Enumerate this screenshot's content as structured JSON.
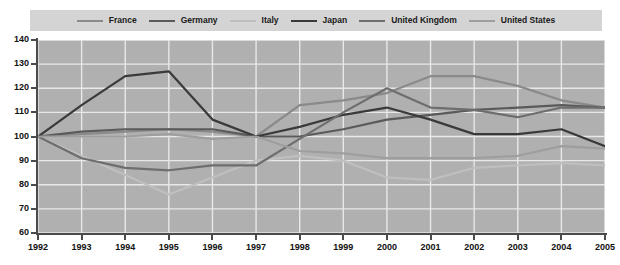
{
  "chart_data": {
    "type": "line",
    "title": "",
    "xlabel": "",
    "ylabel": "",
    "ylim": [
      60,
      140
    ],
    "ytick_step": 10,
    "yticks": [
      140,
      130,
      120,
      110,
      100,
      90,
      80,
      70,
      60
    ],
    "grid": true,
    "legend_position": "top",
    "categories": [
      "1992",
      "1993",
      "1994",
      "1995",
      "1996",
      "1997",
      "1998",
      "1999",
      "2000",
      "2001",
      "2002",
      "2003",
      "2004",
      "2005"
    ],
    "series": [
      {
        "name": "France",
        "color": "#8a8a8a",
        "values": [
          100,
          101,
          102,
          103,
          102,
          100,
          113,
          115,
          118,
          125,
          125,
          121,
          115,
          112
        ]
      },
      {
        "name": "Germany",
        "color": "#5a5a5a",
        "values": [
          100,
          102,
          103,
          103,
          103,
          100,
          100,
          103,
          107,
          109,
          111,
          112,
          113,
          112
        ]
      },
      {
        "name": "Italy",
        "color": "#bfbfbf",
        "values": [
          100,
          92,
          84,
          76,
          83,
          90,
          92,
          90,
          83,
          82,
          87,
          88,
          89,
          88
        ]
      },
      {
        "name": "Japan",
        "color": "#3a3a3a",
        "values": [
          100,
          113,
          125,
          127,
          107,
          100,
          104,
          109,
          112,
          107,
          101,
          101,
          103,
          96
        ]
      },
      {
        "name": "United Kingdom",
        "color": "#6e6e6e",
        "values": [
          100,
          91,
          87,
          86,
          88,
          88,
          99,
          110,
          120,
          112,
          111,
          108,
          112,
          112
        ]
      },
      {
        "name": "United States",
        "color": "#9e9e9e",
        "values": [
          100,
          100,
          100,
          101,
          99,
          100,
          94,
          93,
          91,
          91,
          91,
          92,
          96,
          95
        ]
      }
    ]
  },
  "legend": {
    "items": [
      {
        "label": "France"
      },
      {
        "label": "Germany"
      },
      {
        "label": "Italy"
      },
      {
        "label": "Japan"
      },
      {
        "label": "United Kingdom"
      },
      {
        "label": "United States"
      }
    ]
  },
  "axes": {
    "y_labels": [
      "140",
      "130",
      "120",
      "110",
      "100",
      "90",
      "80",
      "70",
      "60"
    ],
    "x_labels": [
      "1992",
      "1993",
      "1994",
      "1995",
      "1996",
      "1997",
      "1998",
      "1999",
      "2000",
      "2001",
      "2002",
      "2003",
      "2004",
      "2005"
    ]
  },
  "colors": {
    "plot_background": "#b0b0b0",
    "legend_background": "#d4d4d4",
    "gridline": "#e8e8e8",
    "axis": "#4b4b4b",
    "text": "#111111"
  }
}
